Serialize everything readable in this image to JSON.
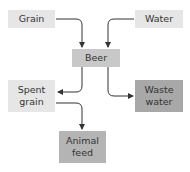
{
  "diagram": {
    "nodes": {
      "grain": {
        "label": "Grain",
        "fill": "#e6e6e6"
      },
      "water": {
        "label": "Water",
        "fill": "#e6e6e6"
      },
      "beer": {
        "label": "Beer",
        "fill": "#c8c8c8"
      },
      "spent_grain": {
        "label": "Spent grain",
        "line1": "Spent",
        "line2": "grain",
        "fill": "#e6e6e6"
      },
      "waste_water": {
        "label": "Waste water",
        "line1": "Waste",
        "line2": "water",
        "fill": "#a8a8a8"
      },
      "animal_feed": {
        "label": "Animal feed",
        "line1": "Animal",
        "line2": "feed",
        "fill": "#b4b4b4"
      }
    },
    "edges": [
      {
        "from": "Grain",
        "to": "Beer"
      },
      {
        "from": "Water",
        "to": "Beer"
      },
      {
        "from": "Beer",
        "to": "Spent grain"
      },
      {
        "from": "Beer",
        "to": "Waste water"
      },
      {
        "from": "Spent grain",
        "to": "Animal feed"
      }
    ]
  }
}
